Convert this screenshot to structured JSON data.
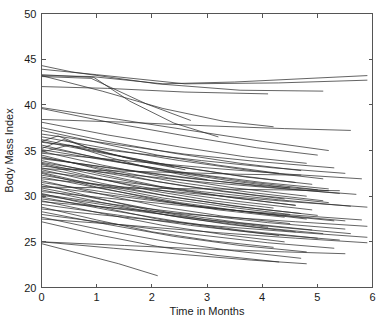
{
  "chart_data": {
    "type": "line",
    "title": "",
    "xlabel": "Time in Months",
    "ylabel": "Body Mass Index",
    "xlim": [
      0,
      6
    ],
    "ylim": [
      20,
      50
    ],
    "xticks": [
      0,
      1,
      2,
      3,
      4,
      5,
      6
    ],
    "yticks": [
      20,
      25,
      30,
      35,
      40,
      45,
      50
    ],
    "xtick_labels": [
      "0",
      "1",
      "2",
      "3",
      "4",
      "5",
      "6"
    ],
    "ytick_labels": [
      "20",
      "25",
      "30",
      "35",
      "40",
      "45",
      "50"
    ],
    "grid": false,
    "legend": null,
    "legend_position": "none",
    "box": true,
    "tick_direction": "in",
    "line_color": "#2b2b2b",
    "background_color": "#ffffff",
    "series": [
      {
        "name": "subject-01",
        "x": [
          0,
          0.55,
          2.1,
          3.6,
          5.1
        ],
        "y": [
          44.3,
          43.6,
          42.3,
          41.6,
          41.5
        ]
      },
      {
        "name": "subject-02",
        "x": [
          0,
          1.0,
          2.6,
          4.3,
          5.9
        ],
        "y": [
          43.9,
          43.3,
          42.3,
          42.4,
          42.7
        ]
      },
      {
        "name": "subject-03",
        "x": [
          0,
          0.9,
          2.2,
          3.5,
          5.9
        ],
        "y": [
          43.2,
          43.1,
          42.3,
          42.5,
          43.2
        ]
      },
      {
        "name": "subject-04",
        "x": [
          0,
          0.95,
          1.6,
          2.4,
          3.2
        ],
        "y": [
          43.3,
          43.0,
          40.4,
          38.0,
          36.5
        ]
      },
      {
        "name": "subject-05",
        "x": [
          0,
          0.9,
          1.9,
          2.7
        ],
        "y": [
          43.1,
          42.9,
          40.1,
          38.3
        ]
      },
      {
        "name": "subject-06",
        "x": [
          0,
          1.2,
          2.6,
          4.1
        ],
        "y": [
          42.0,
          41.8,
          41.4,
          41.2
        ]
      },
      {
        "name": "subject-07",
        "x": [
          0,
          1.1,
          2.2,
          3.3,
          4.2
        ],
        "y": [
          43.2,
          41.5,
          39.6,
          38.2,
          37.6
        ]
      },
      {
        "name": "subject-08",
        "x": [
          0,
          1.4,
          2.8,
          4.0,
          5.2
        ],
        "y": [
          39.7,
          38.4,
          37.1,
          36.0,
          35.0
        ]
      },
      {
        "name": "subject-09",
        "x": [
          0,
          1.3,
          2.7,
          3.9,
          5.0
        ],
        "y": [
          39.6,
          38.0,
          36.5,
          35.3,
          34.5
        ]
      },
      {
        "name": "subject-10",
        "x": [
          0,
          1.5,
          3.0,
          4.4,
          5.6
        ],
        "y": [
          38.4,
          38.1,
          37.7,
          37.4,
          37.2
        ]
      },
      {
        "name": "subject-11",
        "x": [
          0,
          1.2,
          2.5,
          3.7,
          4.8
        ],
        "y": [
          38.1,
          36.7,
          35.4,
          34.3,
          33.6
        ]
      },
      {
        "name": "subject-12",
        "x": [
          0,
          1.1,
          2.4,
          3.6,
          4.7
        ],
        "y": [
          37.5,
          36.1,
          34.7,
          33.6,
          32.8
        ]
      },
      {
        "name": "subject-13",
        "x": [
          0,
          0.3,
          0.8,
          1.6,
          2.4
        ],
        "y": [
          36.0,
          36.6,
          35.4,
          34.1,
          33.2
        ]
      },
      {
        "name": "subject-14",
        "x": [
          0,
          0.4,
          1.0,
          1.8,
          2.6
        ],
        "y": [
          35.2,
          36.2,
          35.0,
          33.8,
          32.9
        ]
      },
      {
        "name": "subject-15",
        "x": [
          0,
          1.0,
          2.1,
          3.2,
          4.3
        ],
        "y": [
          37.2,
          35.9,
          34.5,
          33.4,
          32.5
        ]
      },
      {
        "name": "subject-16",
        "x": [
          0,
          1.3,
          2.6,
          3.9,
          5.3
        ],
        "y": [
          36.8,
          35.7,
          34.6,
          33.8,
          33.1
        ]
      },
      {
        "name": "subject-17",
        "x": [
          0,
          1.2,
          2.5,
          3.8,
          5.1
        ],
        "y": [
          36.5,
          35.2,
          33.9,
          32.8,
          31.9
        ]
      },
      {
        "name": "subject-18",
        "x": [
          0,
          1.1,
          2.3,
          3.5,
          4.6
        ],
        "y": [
          36.2,
          34.8,
          33.4,
          32.3,
          31.5
        ]
      },
      {
        "name": "subject-19",
        "x": [
          0,
          1.4,
          2.9,
          4.2,
          5.5
        ],
        "y": [
          35.9,
          34.9,
          33.9,
          33.1,
          32.5
        ]
      },
      {
        "name": "subject-20",
        "x": [
          0,
          1.0,
          2.2,
          3.4,
          4.5
        ],
        "y": [
          35.6,
          34.2,
          32.8,
          31.7,
          30.9
        ]
      },
      {
        "name": "subject-21",
        "x": [
          0,
          1.2,
          2.4,
          3.7,
          5.0
        ],
        "y": [
          35.4,
          34.0,
          32.7,
          31.6,
          30.7
        ]
      },
      {
        "name": "subject-22",
        "x": [
          0,
          1.3,
          2.7,
          4.0,
          5.2
        ],
        "y": [
          35.1,
          33.8,
          32.5,
          31.5,
          30.8
        ]
      },
      {
        "name": "subject-23",
        "x": [
          0,
          1.1,
          2.3,
          3.5,
          4.8
        ],
        "y": [
          34.9,
          33.4,
          32.0,
          30.9,
          30.0
        ]
      },
      {
        "name": "subject-24",
        "x": [
          0,
          1.5,
          3.0,
          4.5,
          5.8
        ],
        "y": [
          34.7,
          33.9,
          33.1,
          32.4,
          31.9
        ]
      },
      {
        "name": "subject-25",
        "x": [
          0,
          1.0,
          2.1,
          3.3,
          4.4
        ],
        "y": [
          34.5,
          33.0,
          31.6,
          30.5,
          29.7
        ]
      },
      {
        "name": "subject-26",
        "x": [
          0,
          1.2,
          2.5,
          3.8,
          5.1
        ],
        "y": [
          34.3,
          32.9,
          31.5,
          30.4,
          29.5
        ]
      },
      {
        "name": "subject-27",
        "x": [
          0,
          1.4,
          2.8,
          4.1,
          5.4
        ],
        "y": [
          34.1,
          33.0,
          31.9,
          31.0,
          30.3
        ]
      },
      {
        "name": "subject-28",
        "x": [
          0,
          1.1,
          2.2,
          3.4,
          4.6
        ],
        "y": [
          33.9,
          32.4,
          31.0,
          29.9,
          29.0
        ]
      },
      {
        "name": "subject-29",
        "x": [
          0,
          1.3,
          2.6,
          3.9,
          5.2
        ],
        "y": [
          33.7,
          32.4,
          31.1,
          30.1,
          29.3
        ]
      },
      {
        "name": "subject-30",
        "x": [
          0,
          1.0,
          2.0,
          3.1,
          4.2
        ],
        "y": [
          33.5,
          32.0,
          30.6,
          29.5,
          28.7
        ]
      },
      {
        "name": "subject-31",
        "x": [
          0,
          1.5,
          3.0,
          4.4,
          5.7
        ],
        "y": [
          33.3,
          32.4,
          31.5,
          30.8,
          30.2
        ]
      },
      {
        "name": "subject-32",
        "x": [
          0,
          1.2,
          2.4,
          3.6,
          4.9
        ],
        "y": [
          33.1,
          31.7,
          30.4,
          29.4,
          28.5
        ]
      },
      {
        "name": "subject-33",
        "x": [
          0,
          1.1,
          2.3,
          3.5,
          4.7
        ],
        "y": [
          32.9,
          31.4,
          30.0,
          28.9,
          28.1
        ]
      },
      {
        "name": "subject-34",
        "x": [
          0,
          1.4,
          2.9,
          4.3,
          5.6
        ],
        "y": [
          32.7,
          31.6,
          30.5,
          29.6,
          28.9
        ]
      },
      {
        "name": "subject-35",
        "x": [
          0,
          1.0,
          2.1,
          3.2,
          4.4
        ],
        "y": [
          32.5,
          31.0,
          29.6,
          28.5,
          27.7
        ]
      },
      {
        "name": "subject-36",
        "x": [
          0,
          1.3,
          2.6,
          3.8,
          5.0
        ],
        "y": [
          32.3,
          31.0,
          29.7,
          28.7,
          27.9
        ]
      },
      {
        "name": "subject-37",
        "x": [
          0,
          1.2,
          2.5,
          3.7,
          4.8
        ],
        "y": [
          32.1,
          30.7,
          29.3,
          28.3,
          27.5
        ]
      },
      {
        "name": "subject-38",
        "x": [
          0,
          1.5,
          3.1,
          4.5,
          5.9
        ],
        "y": [
          31.9,
          31.0,
          30.1,
          29.4,
          28.8
        ]
      },
      {
        "name": "subject-39",
        "x": [
          0,
          1.1,
          2.2,
          3.3,
          4.5
        ],
        "y": [
          31.7,
          30.2,
          28.8,
          27.8,
          27.0
        ]
      },
      {
        "name": "subject-40",
        "x": [
          0,
          1.3,
          2.7,
          4.0,
          5.3
        ],
        "y": [
          31.5,
          30.3,
          29.0,
          28.1,
          27.3
        ]
      },
      {
        "name": "subject-41",
        "x": [
          0,
          1.0,
          2.0,
          3.0,
          4.1
        ],
        "y": [
          31.3,
          29.8,
          28.4,
          27.4,
          26.6
        ]
      },
      {
        "name": "subject-42",
        "x": [
          0,
          1.4,
          2.8,
          4.2,
          5.5
        ],
        "y": [
          31.1,
          30.0,
          28.9,
          28.0,
          27.3
        ]
      },
      {
        "name": "subject-43",
        "x": [
          0,
          1.2,
          2.4,
          3.6,
          4.9
        ],
        "y": [
          30.9,
          29.5,
          28.1,
          27.1,
          26.3
        ]
      },
      {
        "name": "subject-44",
        "x": [
          0,
          1.1,
          2.3,
          3.4,
          4.6
        ],
        "y": [
          30.7,
          29.3,
          27.9,
          26.9,
          26.1
        ]
      },
      {
        "name": "subject-45",
        "x": [
          0,
          1.5,
          3.0,
          4.4,
          5.8
        ],
        "y": [
          30.5,
          29.6,
          28.7,
          28.0,
          27.4
        ]
      },
      {
        "name": "subject-46",
        "x": [
          0,
          1.0,
          2.1,
          3.2,
          4.3
        ],
        "y": [
          30.3,
          28.9,
          27.5,
          26.5,
          25.7
        ]
      },
      {
        "name": "subject-47",
        "x": [
          0,
          1.3,
          2.6,
          3.9,
          5.1
        ],
        "y": [
          30.1,
          28.9,
          27.6,
          26.6,
          25.9
        ]
      },
      {
        "name": "subject-48",
        "x": [
          0,
          1.2,
          2.5,
          3.7,
          5.0
        ],
        "y": [
          29.9,
          28.5,
          27.2,
          26.2,
          25.4
        ]
      },
      {
        "name": "subject-49",
        "x": [
          0,
          1.4,
          2.9,
          4.3,
          5.6
        ],
        "y": [
          29.7,
          28.6,
          27.5,
          26.6,
          25.9
        ]
      },
      {
        "name": "subject-50",
        "x": [
          0,
          1.1,
          2.2,
          3.3,
          4.4
        ],
        "y": [
          29.5,
          28.1,
          26.8,
          25.8,
          25.0
        ]
      },
      {
        "name": "subject-51",
        "x": [
          0,
          1.3,
          2.7,
          4.0,
          5.4
        ],
        "y": [
          29.1,
          28.0,
          26.8,
          25.9,
          25.2
        ]
      },
      {
        "name": "subject-52",
        "x": [
          0,
          1.0,
          2.0,
          3.1,
          4.2
        ],
        "y": [
          28.8,
          27.4,
          26.1,
          25.1,
          24.4
        ]
      },
      {
        "name": "subject-53",
        "x": [
          0,
          1.5,
          3.0,
          4.5,
          5.9
        ],
        "y": [
          28.6,
          27.7,
          26.8,
          26.1,
          25.5
        ]
      },
      {
        "name": "subject-54",
        "x": [
          0,
          1.2,
          2.4,
          3.6,
          4.8
        ],
        "y": [
          28.3,
          26.9,
          25.6,
          24.6,
          23.9
        ]
      },
      {
        "name": "subject-55",
        "x": [
          0,
          1.4,
          2.8,
          4.1,
          5.3
        ],
        "y": [
          28.0,
          26.9,
          25.8,
          24.9,
          24.3
        ]
      },
      {
        "name": "subject-56",
        "x": [
          0,
          1.1,
          2.3,
          3.5,
          4.7
        ],
        "y": [
          27.7,
          26.3,
          25.0,
          24.0,
          23.2
        ]
      },
      {
        "name": "subject-57",
        "x": [
          0,
          1.6,
          3.2,
          4.6,
          5.9
        ],
        "y": [
          27.5,
          26.8,
          26.0,
          25.4,
          24.9
        ]
      },
      {
        "name": "subject-58",
        "x": [
          0,
          1.0,
          2.1,
          3.2,
          4.3
        ],
        "y": [
          27.2,
          25.8,
          24.5,
          23.5,
          22.8
        ]
      },
      {
        "name": "subject-59",
        "x": [
          0,
          1.5,
          3.0,
          4.4,
          5.5
        ],
        "y": [
          25.0,
          24.6,
          24.2,
          23.9,
          23.7
        ]
      },
      {
        "name": "subject-60",
        "x": [
          0,
          1.3,
          2.6,
          3.8,
          4.8
        ],
        "y": [
          25.0,
          24.3,
          23.6,
          23.0,
          22.6
        ]
      },
      {
        "name": "subject-61",
        "x": [
          0,
          0.7,
          1.4,
          2.1
        ],
        "y": [
          24.8,
          23.7,
          22.6,
          21.3
        ]
      },
      {
        "name": "subject-62",
        "x": [
          0,
          1.2,
          2.5,
          3.7,
          4.9
        ],
        "y": [
          36.0,
          34.6,
          33.2,
          32.1,
          31.3
        ]
      },
      {
        "name": "subject-63",
        "x": [
          0,
          0.5,
          1.2,
          2.0,
          3.0
        ],
        "y": [
          34.8,
          35.6,
          34.3,
          33.0,
          31.8
        ]
      },
      {
        "name": "subject-64",
        "x": [
          0,
          1.1,
          2.4,
          3.6,
          4.7
        ],
        "y": [
          33.0,
          32.8,
          32.6,
          32.4,
          32.3
        ]
      },
      {
        "name": "subject-65",
        "x": [
          0,
          1.4,
          2.9,
          4.2,
          5.4
        ],
        "y": [
          31.0,
          30.9,
          30.8,
          30.7,
          30.6
        ]
      },
      {
        "name": "subject-66",
        "x": [
          0,
          1.2,
          2.6,
          3.9,
          5.2
        ],
        "y": [
          34.2,
          33.1,
          32.0,
          31.2,
          30.6
        ]
      },
      {
        "name": "subject-67",
        "x": [
          0,
          1.0,
          2.2,
          3.4,
          4.5
        ],
        "y": [
          32.6,
          31.2,
          29.8,
          28.8,
          28.0
        ]
      },
      {
        "name": "subject-68",
        "x": [
          0,
          1.3,
          2.8,
          4.1,
          5.5
        ],
        "y": [
          30.2,
          29.1,
          28.0,
          27.1,
          26.4
        ]
      },
      {
        "name": "subject-69",
        "x": [
          0,
          1.1,
          2.3,
          3.5,
          4.6
        ],
        "y": [
          33.6,
          32.2,
          30.8,
          29.8,
          29.0
        ]
      },
      {
        "name": "subject-70",
        "x": [
          0,
          1.5,
          3.1,
          4.6,
          5.9
        ],
        "y": [
          29.4,
          28.6,
          27.8,
          27.2,
          26.7
        ]
      }
    ]
  }
}
